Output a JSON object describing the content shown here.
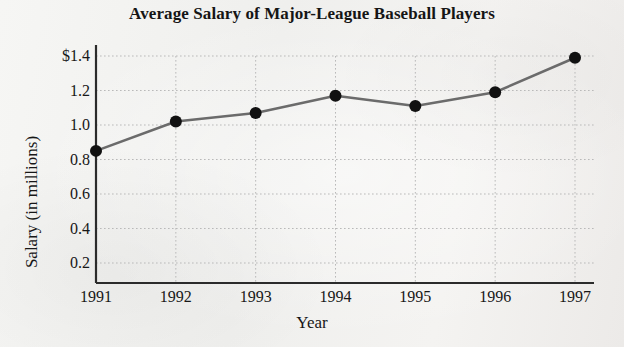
{
  "chart_data": {
    "type": "line",
    "title": "Average Salary of Major-League Baseball Players",
    "xlabel": "Year",
    "ylabel": "Salary (in millions)",
    "categories": [
      "1991",
      "1992",
      "1993",
      "1994",
      "1995",
      "1996",
      "1997"
    ],
    "x": [
      1991,
      1992,
      1993,
      1994,
      1995,
      1996,
      1997
    ],
    "values": [
      0.85,
      1.02,
      1.07,
      1.17,
      1.11,
      1.19,
      1.39
    ],
    "series": [
      {
        "name": "Average Salary",
        "values": [
          0.85,
          1.02,
          1.07,
          1.17,
          1.11,
          1.19,
          1.39
        ]
      }
    ],
    "ylim": [
      0,
      1.5
    ],
    "xlim": [
      1990.6,
      1997.4
    ],
    "yticks": [
      0.2,
      0.4,
      0.6,
      0.8,
      1.0,
      1.2,
      1.4
    ],
    "ytick_labels": [
      "0.2",
      "0.4",
      "0.6",
      "0.8",
      "1.0",
      "1.2",
      "$1.4"
    ],
    "xticks": [
      1991,
      1992,
      1993,
      1994,
      1995,
      1996,
      1997
    ],
    "xtick_labels": [
      "1991",
      "1992",
      "1993",
      "1994",
      "1995",
      "1996",
      "1997"
    ],
    "grid": "both-dotted",
    "legend": "none",
    "line_color": "#6b6b6b",
    "marker_color": "#111111",
    "axis_color": "#2b2b2b",
    "grid_color": "#b9b9b9",
    "background_color": "#f2f2f0"
  }
}
